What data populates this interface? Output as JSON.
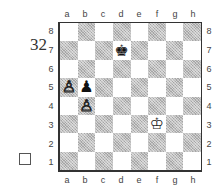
{
  "diagram": {
    "number": "32",
    "side_to_move_indicator": "empty-square (white to move)",
    "files": [
      "a",
      "b",
      "c",
      "d",
      "e",
      "f",
      "g",
      "h"
    ],
    "ranks": [
      "8",
      "7",
      "6",
      "5",
      "4",
      "3",
      "2",
      "1"
    ],
    "pieces": [
      {
        "square": "d7",
        "color": "black",
        "type": "king",
        "glyph": "♚"
      },
      {
        "square": "b5",
        "color": "black",
        "type": "pawn",
        "glyph": "♟"
      },
      {
        "square": "a5",
        "color": "white",
        "type": "pawn",
        "glyph": "♙"
      },
      {
        "square": "b4",
        "color": "white",
        "type": "pawn",
        "glyph": "♙"
      },
      {
        "square": "f3",
        "color": "white",
        "type": "king",
        "glyph": "♔"
      }
    ]
  }
}
